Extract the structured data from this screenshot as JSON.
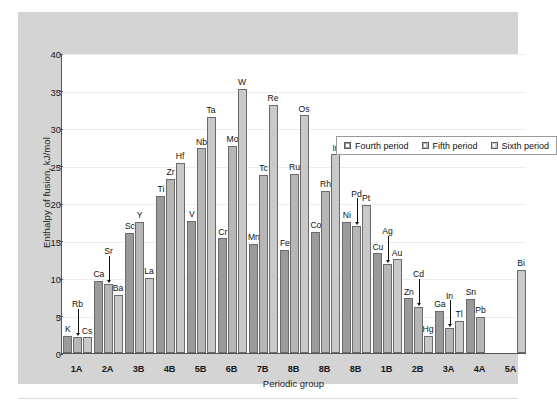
{
  "chart_data": {
    "type": "bar",
    "title": "",
    "xlabel": "Periodic group",
    "ylabel": "Enthalpy of fusion, kJ/mol",
    "ylim": [
      0,
      40
    ],
    "ytick_step": 5,
    "yticks": [
      0,
      5,
      10,
      15,
      20,
      25,
      30,
      35,
      40
    ],
    "grid": true,
    "legend_position": "top-center-right",
    "categories": [
      "1A",
      "2A",
      "3B",
      "4B",
      "5B",
      "6B",
      "7B",
      "8B",
      "8B",
      "8B",
      "1B",
      "2B",
      "3A",
      "4A",
      "5A"
    ],
    "series": [
      {
        "name": "Fourth period",
        "color": "#9a9a9a",
        "values": [
          2.3,
          9.6,
          16.0,
          21.0,
          17.6,
          15.3,
          14.6,
          13.8,
          16.2,
          17.5,
          13.3,
          7.3,
          5.6,
          7.2,
          null
        ],
        "element_labels": [
          "K",
          "Ca",
          "Sc",
          "Ti",
          "V",
          "Cr",
          "Mn",
          "Fe",
          "Co",
          "Ni",
          "Cu",
          "Zn",
          "Ga",
          "Sn",
          ""
        ]
      },
      {
        "name": "Fifth period",
        "color": "#b6b6b6",
        "values": [
          2.2,
          9.2,
          17.5,
          23.2,
          27.3,
          27.6,
          23.8,
          23.9,
          21.6,
          16.9,
          11.9,
          6.2,
          3.3,
          4.8,
          null
        ],
        "element_labels": [
          "Rb",
          "Sr",
          "Y",
          "Zr",
          "Nb",
          "Mo",
          "Tc",
          "Ru",
          "Rh",
          "Pd",
          "Ag",
          "Cd",
          "In",
          "Pb",
          ""
        ]
      },
      {
        "name": "Sixth period",
        "color": "#c9c9c9",
        "values": [
          2.1,
          7.8,
          10.0,
          25.4,
          31.5,
          35.2,
          33.1,
          31.7,
          26.5,
          19.8,
          12.5,
          2.3,
          4.3,
          null,
          11.1
        ],
        "element_labels": [
          "Cs",
          "Ba",
          "La",
          "Hf",
          "Ta",
          "W",
          "Re",
          "Os",
          "Ir",
          "Pt",
          "Au",
          "Hg",
          "Tl",
          "",
          "Bi"
        ]
      }
    ],
    "annotations": [
      {
        "label": "Rb",
        "style": "callout-arrow-down",
        "target_series": "Fifth period",
        "target_category": "1A"
      },
      {
        "label": "Sr",
        "style": "callout-arrow-down",
        "target_series": "Fifth period",
        "target_category": "2A"
      },
      {
        "label": "Pd",
        "style": "callout-arrow-down",
        "target_series": "Fifth period",
        "target_category": "8B"
      },
      {
        "label": "Ag",
        "style": "callout-arrow-down",
        "target_series": "Fifth period",
        "target_category": "1B"
      },
      {
        "label": "Cd",
        "style": "callout-arrow-down",
        "target_series": "Fifth period",
        "target_category": "2B"
      },
      {
        "label": "In",
        "style": "callout-arrow-down",
        "target_series": "Fifth period",
        "target_category": "3A"
      }
    ]
  },
  "axes": {
    "y_title": "Enthalpy of fusion, kJ/mol",
    "x_title": "Periodic group",
    "ytick_labels": [
      "0",
      "5",
      "10",
      "15",
      "20",
      "25",
      "30",
      "35",
      "40"
    ],
    "xtick_labels": [
      "1A",
      "2A",
      "3B",
      "4B",
      "5B",
      "6B",
      "7B",
      "8B",
      "8B",
      "8B",
      "1B",
      "2B",
      "3A",
      "4A",
      "5A"
    ]
  },
  "legend": {
    "items": [
      {
        "label": "Fourth period",
        "swatch": "square-swatch-dark"
      },
      {
        "label": "Fifth period",
        "swatch": "square-swatch-medium"
      },
      {
        "label": "Sixth period",
        "swatch": "square-swatch-light"
      }
    ]
  },
  "colors": {
    "fourth_period": "#9a9a9a",
    "fifth_period": "#b6b6b6",
    "sixth_period": "#c9c9c9",
    "panel_background": "#d4d4d4",
    "plot_background": "#ffffff",
    "axis": "#555555",
    "gridline": "#eeeeee"
  }
}
